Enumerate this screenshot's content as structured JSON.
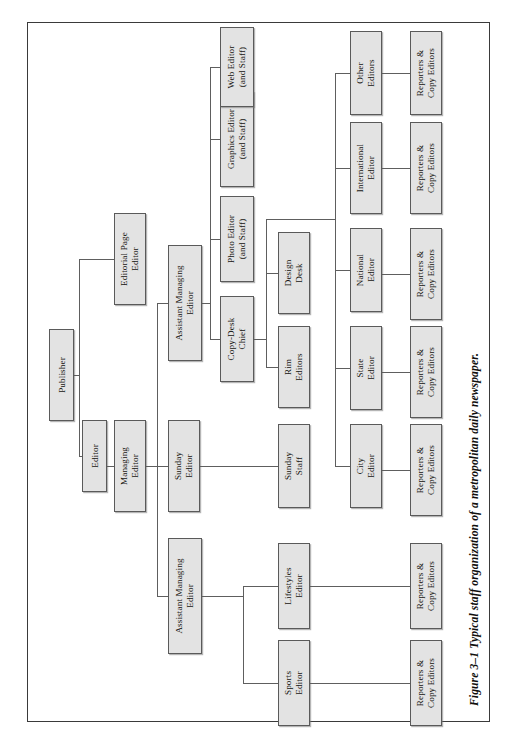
{
  "figure": {
    "number": "Figure 3–1",
    "caption": "Typical staff organization of a metropolitan daily newspaper.",
    "full_caption": "Figure 3–1  Typical staff organization of a metropolitan daily newspaper.",
    "orientation": "rotated-90-ccw",
    "colors": {
      "box_fill": "#e3e3e3",
      "box_border": "#5a5a5a",
      "connector": "#5e5e5e",
      "frame": "#3a3a3a",
      "text": "#15130f",
      "page": "#ffffff"
    }
  },
  "chart_data": {
    "type": "diagram",
    "diagram_type": "organization-chart",
    "title": "Typical staff organization of a metropolitan daily newspaper.",
    "node_count": 27,
    "nodes": [
      {
        "id": "publisher",
        "label": "Publisher",
        "lines": [
          "Publisher"
        ],
        "level": 0
      },
      {
        "id": "editor",
        "label": "Editor",
        "lines": [
          "Editor"
        ],
        "level": 1
      },
      {
        "id": "editorial_page",
        "label": "Editorial Page Editor",
        "lines": [
          "Editorial Page",
          "Editor"
        ],
        "level": 1
      },
      {
        "id": "managing_editor",
        "label": "Managing Editor",
        "lines": [
          "Managing",
          "Editor"
        ],
        "level": 2
      },
      {
        "id": "ame_news",
        "label": "Assistant Managing Editor",
        "lines": [
          "Assistant Managing",
          "Editor"
        ],
        "level": 3
      },
      {
        "id": "sunday_editor",
        "label": "Sunday Editor",
        "lines": [
          "Sunday",
          "Editor"
        ],
        "level": 3
      },
      {
        "id": "ame_features",
        "label": "Assistant Managing Editor",
        "lines": [
          "Assistant Managing",
          "Editor"
        ],
        "level": 3
      },
      {
        "id": "copy_desk_chief",
        "label": "Copy-Desk Chief",
        "lines": [
          "Copy-Desk",
          "Chief"
        ],
        "level": 4
      },
      {
        "id": "photo_editor",
        "label": "Photo Editor (and Staff)",
        "lines": [
          "Photo Editor",
          "(and Staff)"
        ],
        "level": 4
      },
      {
        "id": "graphics_editor",
        "label": "Graphics Editor (and Staff)",
        "lines": [
          "Graphics Editor",
          "(and Staff)"
        ],
        "level": 4
      },
      {
        "id": "web_editor",
        "label": "Web Editor (and Staff)",
        "lines": [
          "Web Editor",
          "(and Staff)"
        ],
        "level": 4
      },
      {
        "id": "sunday_staff",
        "label": "Sunday Staff",
        "lines": [
          "Sunday",
          "Staff"
        ],
        "level": 4
      },
      {
        "id": "rim_editors",
        "label": "Rim Editors",
        "lines": [
          "Rim",
          "Editors"
        ],
        "level": 5
      },
      {
        "id": "design_desk",
        "label": "Design Desk",
        "lines": [
          "Design",
          "Desk"
        ],
        "level": 5
      },
      {
        "id": "lifestyles_editor",
        "label": "Lifestyles Editor",
        "lines": [
          "Lifestyles",
          "Editor"
        ],
        "level": 4
      },
      {
        "id": "sports_editor",
        "label": "Sports Editor",
        "lines": [
          "Sports",
          "Editor"
        ],
        "level": 4
      },
      {
        "id": "city_editor",
        "label": "City Editor",
        "lines": [
          "City",
          "Editor"
        ],
        "level": 5
      },
      {
        "id": "state_editor",
        "label": "State Editor",
        "lines": [
          "State",
          "Editor"
        ],
        "level": 5
      },
      {
        "id": "national_editor",
        "label": "National Editor",
        "lines": [
          "National",
          "Editor"
        ],
        "level": 5
      },
      {
        "id": "international_editor",
        "label": "International Editor",
        "lines": [
          "International",
          "Editor"
        ],
        "level": 5
      },
      {
        "id": "other_editors",
        "label": "Other Editors",
        "lines": [
          "Other",
          "Editors"
        ],
        "level": 5
      },
      {
        "id": "rc_sports",
        "label": "Reporters & Copy Editors",
        "lines": [
          "Reporters &",
          "Copy Editors"
        ],
        "level": 5
      },
      {
        "id": "rc_lifestyles",
        "label": "Reporters & Copy Editors",
        "lines": [
          "Reporters &",
          "Copy Editors"
        ],
        "level": 5
      },
      {
        "id": "rc_city",
        "label": "Reporters & Copy Editors",
        "lines": [
          "Reporters &",
          "Copy Editors"
        ],
        "level": 6
      },
      {
        "id": "rc_state",
        "label": "Reporters & Copy Editors",
        "lines": [
          "Reporters &",
          "Copy Editors"
        ],
        "level": 6
      },
      {
        "id": "rc_national",
        "label": "Reporters & Copy Editors",
        "lines": [
          "Reporters &",
          "Copy Editors"
        ],
        "level": 6
      },
      {
        "id": "rc_international",
        "label": "Reporters & Copy Editors",
        "lines": [
          "Reporters &",
          "Copy Editors"
        ],
        "level": 6
      },
      {
        "id": "rc_other",
        "label": "Reporters & Copy Editors",
        "lines": [
          "Reporters &",
          "Copy Editors"
        ],
        "level": 6
      }
    ],
    "edges": [
      {
        "from": "publisher",
        "to": "editor"
      },
      {
        "from": "publisher",
        "to": "editorial_page"
      },
      {
        "from": "editor",
        "to": "managing_editor"
      },
      {
        "from": "managing_editor",
        "to": "ame_news"
      },
      {
        "from": "managing_editor",
        "to": "sunday_editor"
      },
      {
        "from": "managing_editor",
        "to": "ame_features"
      },
      {
        "from": "ame_news",
        "to": "copy_desk_chief"
      },
      {
        "from": "ame_news",
        "to": "photo_editor"
      },
      {
        "from": "ame_news",
        "to": "graphics_editor"
      },
      {
        "from": "ame_news",
        "to": "web_editor"
      },
      {
        "from": "sunday_editor",
        "to": "sunday_staff"
      },
      {
        "from": "copy_desk_chief",
        "to": "rim_editors"
      },
      {
        "from": "copy_desk_chief",
        "to": "design_desk"
      },
      {
        "from": "ame_features",
        "to": "lifestyles_editor"
      },
      {
        "from": "ame_features",
        "to": "sports_editor"
      },
      {
        "from": "sports_editor",
        "to": "rc_sports"
      },
      {
        "from": "lifestyles_editor",
        "to": "rc_lifestyles"
      },
      {
        "from": "copy_desk_chief",
        "to": "city_editor"
      },
      {
        "from": "copy_desk_chief",
        "to": "state_editor"
      },
      {
        "from": "copy_desk_chief",
        "to": "national_editor"
      },
      {
        "from": "copy_desk_chief",
        "to": "international_editor"
      },
      {
        "from": "copy_desk_chief",
        "to": "other_editors"
      },
      {
        "from": "city_editor",
        "to": "rc_city"
      },
      {
        "from": "state_editor",
        "to": "rc_state"
      },
      {
        "from": "national_editor",
        "to": "rc_national"
      },
      {
        "from": "international_editor",
        "to": "rc_international"
      },
      {
        "from": "other_editors",
        "to": "rc_other"
      }
    ]
  },
  "geometry": {
    "nodes": {
      "publisher": {
        "x": 49,
        "y": 329,
        "w": 25,
        "h": 92
      },
      "editor": {
        "x": 82,
        "y": 420,
        "w": 25,
        "h": 72
      },
      "editorial_page": {
        "x": 114,
        "y": 213,
        "w": 32,
        "h": 92
      },
      "managing_editor": {
        "x": 114,
        "y": 420,
        "w": 32,
        "h": 92
      },
      "ame_news": {
        "x": 168,
        "y": 245,
        "w": 34,
        "h": 116
      },
      "sunday_editor": {
        "x": 168,
        "y": 420,
        "w": 32,
        "h": 92
      },
      "ame_features": {
        "x": 168,
        "y": 538,
        "w": 34,
        "h": 116
      },
      "copy_desk_chief": {
        "x": 220,
        "y": 296,
        "w": 34,
        "h": 86
      },
      "photo_editor": {
        "x": 220,
        "y": 196,
        "w": 34,
        "h": 86
      },
      "graphics_editor": {
        "x": 220,
        "y": 91,
        "w": 34,
        "h": 96
      },
      "web_editor": {
        "x": 220,
        "y": 27,
        "w": 34,
        "h": 80
      },
      "sunday_staff": {
        "x": 278,
        "y": 424,
        "w": 32,
        "h": 84
      },
      "rim_editors": {
        "x": 278,
        "y": 326,
        "w": 32,
        "h": 82
      },
      "design_desk": {
        "x": 278,
        "y": 232,
        "w": 32,
        "h": 82
      },
      "lifestyles_editor": {
        "x": 278,
        "y": 543,
        "w": 32,
        "h": 86
      },
      "sports_editor": {
        "x": 278,
        "y": 640,
        "w": 32,
        "h": 86
      },
      "city_editor": {
        "x": 350,
        "y": 424,
        "w": 32,
        "h": 84
      },
      "state_editor": {
        "x": 350,
        "y": 326,
        "w": 32,
        "h": 84
      },
      "national_editor": {
        "x": 350,
        "y": 228,
        "w": 32,
        "h": 84
      },
      "international_editor": {
        "x": 350,
        "y": 122,
        "w": 32,
        "h": 92
      },
      "other_editors": {
        "x": 350,
        "y": 31,
        "w": 32,
        "h": 84
      },
      "rc_sports": {
        "x": 410,
        "y": 640,
        "w": 32,
        "h": 86
      },
      "rc_lifestyles": {
        "x": 410,
        "y": 543,
        "w": 32,
        "h": 86
      },
      "rc_city": {
        "x": 410,
        "y": 424,
        "w": 32,
        "h": 92
      },
      "rc_state": {
        "x": 410,
        "y": 326,
        "w": 32,
        "h": 92
      },
      "rc_national": {
        "x": 410,
        "y": 228,
        "w": 32,
        "h": 92
      },
      "rc_international": {
        "x": 410,
        "y": 122,
        "w": 32,
        "h": 92
      },
      "rc_other": {
        "x": 410,
        "y": 31,
        "w": 32,
        "h": 84
      }
    }
  }
}
